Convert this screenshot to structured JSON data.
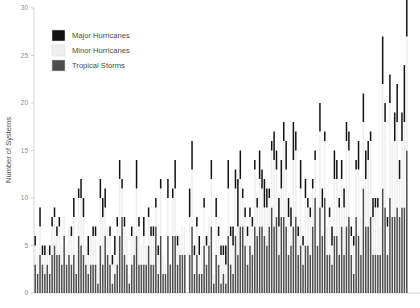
{
  "chart_data": {
    "type": "bar",
    "subtype": "stacked-bar",
    "title": "",
    "xlabel": "",
    "ylabel": "Number of Systems",
    "ylim": [
      0,
      30
    ],
    "yticks": [
      0,
      5,
      10,
      15,
      20,
      25,
      30
    ],
    "ytick_labels": [
      "0",
      "5",
      "10",
      "15",
      "20",
      "25",
      "30"
    ],
    "grid": false,
    "legend_position": "top-left",
    "x_axis_labels_visible": false,
    "categories": [
      "1851",
      "1852",
      "1853",
      "1854",
      "1855",
      "1856",
      "1857",
      "1858",
      "1859",
      "1860",
      "1861",
      "1862",
      "1863",
      "1864",
      "1865",
      "1866",
      "1867",
      "1868",
      "1869",
      "1870",
      "1871",
      "1872",
      "1873",
      "1874",
      "1875",
      "1876",
      "1877",
      "1878",
      "1879",
      "1880",
      "1881",
      "1882",
      "1883",
      "1884",
      "1885",
      "1886",
      "1887",
      "1888",
      "1889",
      "1890",
      "1891",
      "1892",
      "1893",
      "1894",
      "1895",
      "1896",
      "1897",
      "1898",
      "1899",
      "1900",
      "1901",
      "1902",
      "1903",
      "1904",
      "1905",
      "1906",
      "1907",
      "1908",
      "1909",
      "1910",
      "1911",
      "1912",
      "1913",
      "1914",
      "1915",
      "1916",
      "1917",
      "1918",
      "1919",
      "1920",
      "1921",
      "1922",
      "1923",
      "1924",
      "1925",
      "1926",
      "1927",
      "1928",
      "1929",
      "1930",
      "1931",
      "1932",
      "1933",
      "1934",
      "1935",
      "1936",
      "1937",
      "1938",
      "1939",
      "1940",
      "1941",
      "1942",
      "1943",
      "1944",
      "1945",
      "1946",
      "1947",
      "1948",
      "1949",
      "1950",
      "1951",
      "1952",
      "1953",
      "1954",
      "1955",
      "1956",
      "1957",
      "1958",
      "1959",
      "1960",
      "1961",
      "1962",
      "1963",
      "1964",
      "1965",
      "1966",
      "1967",
      "1968",
      "1969",
      "1970",
      "1971",
      "1972",
      "1973",
      "1974",
      "1975",
      "1976",
      "1977",
      "1978",
      "1979",
      "1980",
      "1981",
      "1982",
      "1983",
      "1984",
      "1985",
      "1986",
      "1987",
      "1988",
      "1989",
      "1990",
      "1991",
      "1992",
      "1993",
      "1994",
      "1995",
      "1996",
      "1997",
      "1998",
      "1999",
      "2000",
      "2001",
      "2002",
      "2003",
      "2004",
      "2005"
    ],
    "series": [
      {
        "name": "Tropical Storms",
        "color": "#4d4d4d",
        "values": [
          3,
          2,
          4,
          3,
          2,
          3,
          2,
          4,
          5,
          4,
          4,
          3,
          6,
          3,
          4,
          3,
          4,
          2,
          6,
          5,
          4,
          3,
          2,
          3,
          3,
          3,
          1,
          5,
          3,
          6,
          4,
          3,
          1,
          2,
          3,
          6,
          8,
          4,
          3,
          1,
          3,
          4,
          6,
          3,
          3,
          3,
          3,
          5,
          3,
          3,
          7,
          2,
          6,
          2,
          2,
          6,
          3,
          6,
          6,
          3,
          4,
          4,
          4,
          0,
          4,
          7,
          2,
          4,
          2,
          2,
          5,
          3,
          5,
          7,
          1,
          4,
          3,
          1,
          2,
          1,
          6,
          3,
          2,
          6,
          4,
          7,
          7,
          5,
          3,
          5,
          4,
          7,
          6,
          7,
          7,
          6,
          5,
          7,
          9,
          7,
          8,
          4,
          8,
          8,
          7,
          4,
          5,
          7,
          8,
          4,
          5,
          3,
          5,
          5,
          4,
          7,
          10,
          5,
          9,
          6,
          10,
          4,
          4,
          3,
          6,
          6,
          4,
          7,
          4,
          7,
          8,
          4,
          2,
          8,
          6,
          4,
          11,
          7,
          7,
          8,
          4,
          4,
          4,
          4,
          11,
          9,
          4,
          10,
          8,
          8,
          9,
          8,
          9,
          9,
          15
        ]
      },
      {
        "name": "Minor Hurricanes",
        "color": "#efefef",
        "values": [
          2,
          2,
          3,
          1,
          2,
          2,
          2,
          3,
          3,
          2,
          3,
          2,
          2,
          2,
          3,
          3,
          4,
          2,
          4,
          5,
          4,
          2,
          2,
          3,
          3,
          3,
          2,
          5,
          5,
          3,
          3,
          3,
          2,
          2,
          4,
          6,
          3,
          3,
          3,
          1,
          3,
          3,
          5,
          4,
          2,
          3,
          2,
          3,
          3,
          3,
          2,
          2,
          5,
          2,
          1,
          4,
          0,
          4,
          5,
          2,
          2,
          3,
          3,
          0,
          4,
          6,
          2,
          3,
          2,
          3,
          4,
          2,
          3,
          5,
          1,
          4,
          3,
          3,
          2,
          2,
          5,
          3,
          3,
          5,
          3,
          5,
          3,
          3,
          3,
          3,
          3,
          6,
          3,
          5,
          4,
          3,
          4,
          3,
          6,
          7,
          5,
          3,
          3,
          8,
          6,
          4,
          2,
          7,
          7,
          2,
          6,
          2,
          5,
          4,
          4,
          4,
          4,
          4,
          8,
          3,
          6,
          3,
          4,
          2,
          6,
          6,
          5,
          5,
          5,
          9,
          7,
          2,
          3,
          5,
          7,
          4,
          7,
          5,
          7,
          8,
          4,
          5,
          5,
          3,
          11,
          9,
          3,
          10,
          8,
          8,
          9,
          4,
          7,
          9,
          12
        ]
      },
      {
        "name": "Major Hurricanes",
        "color": "#121212",
        "values": [
          1,
          0,
          2,
          1,
          1,
          0,
          1,
          1,
          1,
          1,
          1,
          0,
          0,
          0,
          0,
          1,
          2,
          0,
          1,
          2,
          2,
          0,
          2,
          0,
          1,
          1,
          0,
          2,
          2,
          2,
          0,
          1,
          1,
          2,
          1,
          2,
          1,
          1,
          0,
          0,
          1,
          0,
          3,
          1,
          0,
          2,
          0,
          1,
          1,
          1,
          1,
          1,
          1,
          0,
          0,
          2,
          0,
          1,
          3,
          1,
          0,
          0,
          0,
          0,
          3,
          3,
          1,
          1,
          2,
          0,
          1,
          1,
          0,
          2,
          0,
          2,
          1,
          1,
          1,
          2,
          3,
          1,
          2,
          2,
          5,
          3,
          1,
          1,
          1,
          1,
          1,
          1,
          1,
          3,
          2,
          3,
          2,
          1,
          1,
          3,
          2,
          3,
          3,
          2,
          3,
          2,
          2,
          4,
          2,
          1,
          3,
          1,
          2,
          1,
          1,
          1,
          1,
          0,
          3,
          2,
          1,
          0,
          1,
          2,
          3,
          2,
          1,
          2,
          2,
          2,
          2,
          1,
          1,
          1,
          3,
          0,
          3,
          3,
          2,
          1,
          2,
          1,
          1,
          0,
          5,
          2,
          1,
          3,
          0,
          3,
          4,
          2,
          3,
          6,
          7
        ]
      }
    ],
    "legend": [
      {
        "label": "Major Hurricanes",
        "color": "#121212"
      },
      {
        "label": "Minor Hurricanes",
        "color": "#efefef"
      },
      {
        "label": "Tropical Storms",
        "color": "#4d4d4d"
      }
    ]
  },
  "geometry": {
    "plot_left": 34,
    "plot_right": 408,
    "plot_top": 8,
    "plot_bottom": 293,
    "axis_color": "#c9c9c9",
    "background": "#ffffff"
  },
  "legend_box": {
    "swatch_x": 52,
    "swatch_w": 13,
    "swatch_h": 11,
    "rows_y": [
      30,
      45,
      60
    ],
    "text_x": 72
  }
}
